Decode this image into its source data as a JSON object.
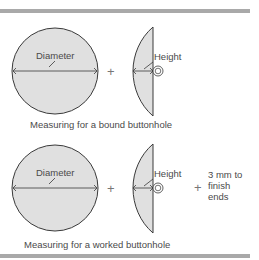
{
  "colors": {
    "fill": "#e0e0e0",
    "stroke": "#3a3a3a",
    "bar": "#a9a9a9",
    "text": "#4a4a4a"
  },
  "panels": [
    {
      "id": "bound",
      "diameter_label": "Diameter",
      "height_label": "Height",
      "operator": "+",
      "caption": "Measuring for a bound buttonhole"
    },
    {
      "id": "worked",
      "diameter_label": "Diameter",
      "height_label": "Height",
      "operator": "+",
      "extra_operator": "+",
      "extra_lines": [
        "3 mm to",
        "finish",
        "ends"
      ],
      "caption": "Measuring for a worked buttonhole"
    }
  ]
}
